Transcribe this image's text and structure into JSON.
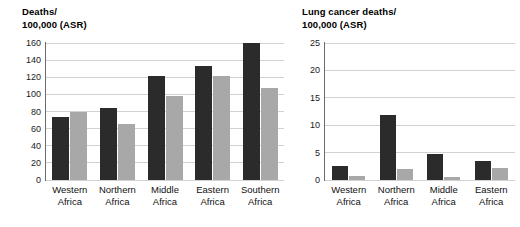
{
  "chart_data": [
    {
      "id": "all-cancer-deaths",
      "type": "bar",
      "title": "Deaths/\n100,000 (ASR)",
      "title_line1": "Deaths/",
      "title_line2": "100,000 (ASR)",
      "xlabel": "",
      "ylabel": "Deaths/100,000 (ASR)",
      "ylim": [
        0,
        160
      ],
      "yticks": [
        0,
        20,
        40,
        60,
        80,
        100,
        120,
        140,
        160
      ],
      "ytick_labels": [
        "0",
        "20",
        "40",
        "60",
        "80",
        "100",
        "120",
        "140",
        "160"
      ],
      "grid": true,
      "legend": "none",
      "categories": [
        "Western\nAfrica",
        "Northern\nAfrica",
        "Middle\nAfrica",
        "Eastern\nAfrica",
        "Southern\nAfrica"
      ],
      "series": [
        {
          "name": "series-dark",
          "color": "#2b2b2b",
          "values": [
            74,
            84,
            121,
            133,
            160
          ]
        },
        {
          "name": "series-light",
          "color": "#a8a8a8",
          "values": [
            80,
            65,
            98,
            122,
            107
          ]
        }
      ]
    },
    {
      "id": "lung-cancer-deaths",
      "type": "bar",
      "title": "Lung cancer deaths/\n100,000 (ASR)",
      "title_line1": "Lung cancer deaths/",
      "title_line2": "100,000 (ASR)",
      "xlabel": "",
      "ylabel": "Lung cancer deaths/100,000 (ASR)",
      "ylim": [
        0,
        25
      ],
      "yticks": [
        0,
        5,
        10,
        15,
        20,
        25
      ],
      "ytick_labels": [
        "0",
        "5",
        "10",
        "15",
        "20",
        "25"
      ],
      "grid": true,
      "legend": "none",
      "categories": [
        "Western\nAfrica",
        "Northern\nAfrica",
        "Middle\nAfrica",
        "Eastern\nAfrica"
      ],
      "series": [
        {
          "name": "series-dark",
          "color": "#2b2b2b",
          "values": [
            2.5,
            11.8,
            4.7,
            3.5
          ]
        },
        {
          "name": "series-light",
          "color": "#a8a8a8",
          "values": [
            0.7,
            2.1,
            0.6,
            2.2
          ]
        }
      ]
    }
  ],
  "colors": {
    "dark_series": "#2b2b2b",
    "light_series": "#a8a8a8",
    "gridline": "#d2d2d2",
    "axis": "#6b6b6b",
    "background": "#ffffff",
    "text": "#000000"
  }
}
